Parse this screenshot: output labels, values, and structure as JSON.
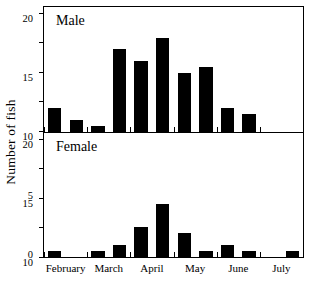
{
  "chart_data": {
    "type": "bar",
    "title": "",
    "xlabel": "",
    "ylabel": "Number of fish",
    "ylim": [
      0,
      21
    ],
    "yticks": [
      0,
      5,
      10,
      15,
      20
    ],
    "ytick_labels": [
      "0",
      "5",
      "10",
      "15",
      "20"
    ],
    "grid": false,
    "legend": "none",
    "month_ticks": [
      "February",
      "March",
      "April",
      "May",
      "June",
      "July"
    ],
    "bin_note": "half-month bins",
    "panels": [
      {
        "name": "male",
        "label": "Male",
        "categories": [
          "Feb 1",
          "Feb 2",
          "Mar 1",
          "Mar 2",
          "Apr 1",
          "Apr 2",
          "May 1",
          "May 2",
          "Jun 1",
          "Jun 2",
          "Jul 1",
          "Jul 2"
        ],
        "values": [
          4,
          2,
          1,
          14,
          12,
          16,
          10,
          11,
          4,
          3,
          0,
          0
        ]
      },
      {
        "name": "female",
        "label": "Female",
        "categories": [
          "Feb 1",
          "Feb 2",
          "Mar 1",
          "Mar 2",
          "Apr 1",
          "Apr 2",
          "May 1",
          "May 2",
          "Jun 1",
          "Jun 2",
          "Jul 1",
          "Jul 2"
        ],
        "values": [
          1,
          0,
          1,
          2,
          5,
          9,
          4,
          1,
          2,
          1,
          0,
          1
        ]
      }
    ]
  },
  "axis": {
    "ylabel": "Number of fish"
  }
}
